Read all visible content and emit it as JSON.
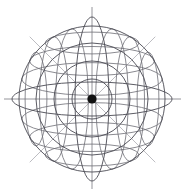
{
  "figure": {
    "name": "wireframe-sphere-diagram",
    "title": "Wireframe sphere with polar and equatorial grid",
    "canvas": {
      "width": 187,
      "height": 193,
      "background": "#ffffff"
    },
    "center": {
      "x": 92,
      "y": 99
    },
    "center_dot": {
      "radius": 4.6,
      "color": "#111111"
    },
    "colors": {
      "primary_line": "#4a4a52",
      "secondary_line": "#6d6d75",
      "diagonal_line": "#bdbdc2",
      "axis_line": "#7a7a82",
      "center_dot": "#111111",
      "background": "#ffffff"
    },
    "stroke_widths": {
      "circle": 0.9,
      "ellipse": 0.9,
      "grid": 0.8,
      "axis": 0.8,
      "diagonal": 1.0
    },
    "concentric_circles": {
      "count": 4,
      "radii": [
        20,
        38,
        56,
        73
      ],
      "color": "#4a4a52"
    },
    "equator_ellipse": {
      "rx": 80,
      "ry": 17,
      "color": "#4a4a52"
    },
    "meridian_ellipse": {
      "rx": 17,
      "ry": 82,
      "color": "#4a4a52"
    },
    "latitude_arcs": {
      "label": "horizontal latitude lines",
      "y_offsets": [
        -56,
        -38,
        -20,
        20,
        38,
        56
      ],
      "color": "#6d6d75"
    },
    "longitude_arcs": {
      "label": "vertical longitude lines",
      "x_offsets": [
        -56,
        -38,
        -20,
        20,
        38,
        56
      ],
      "color": "#6d6d75"
    },
    "axes": {
      "horizontal": {
        "x1": 4,
        "y1": 99,
        "x2": 181,
        "y2": 99,
        "color": "#7a7a82"
      },
      "vertical": {
        "x1": 92,
        "y1": 7,
        "x2": 92,
        "y2": 189,
        "color": "#7a7a82"
      }
    },
    "diagonals": [
      {
        "name": "diagonal-nw-se",
        "x1": 30,
        "y1": 37,
        "x2": 155,
        "y2": 162,
        "color": "#bdbdc2"
      },
      {
        "name": "diagonal-ne-sw",
        "x1": 155,
        "y1": 37,
        "x2": 30,
        "y2": 162,
        "color": "#bdbdc2"
      }
    ]
  }
}
